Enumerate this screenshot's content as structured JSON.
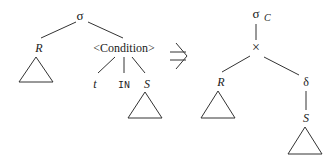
{
  "left_tree": {
    "root": "σ",
    "left_child": "R",
    "right_child": "<Condition>",
    "condition_children": [
      "t",
      "IN",
      "S"
    ]
  },
  "arrow": "⇒",
  "right_tree": {
    "root": "σ",
    "root_subscript": "C",
    "product": "×",
    "left_child": "R",
    "right_child": "δ",
    "delta_child": "S"
  }
}
